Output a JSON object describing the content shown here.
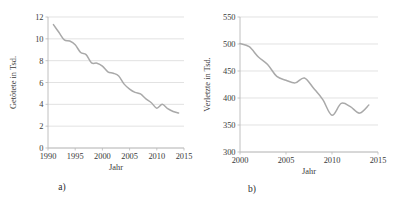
{
  "figure": {
    "panels": [
      {
        "key": "a",
        "label": "a)",
        "chart_data": {
          "type": "line",
          "title": "",
          "xlabel": "Jahr",
          "ylabel": "Getötete in Tsd.",
          "xlim": [
            1990,
            2015
          ],
          "ylim": [
            0,
            12
          ],
          "xticks": [
            1990,
            1995,
            2000,
            2005,
            2010,
            2015
          ],
          "yticks": [
            0,
            2,
            4,
            6,
            8,
            10,
            12
          ],
          "grid": true,
          "legend": "none",
          "line_color": "#a9a9a9",
          "x": [
            1991,
            1992,
            1993,
            1994,
            1995,
            1996,
            1997,
            1998,
            1999,
            2000,
            2001,
            2002,
            2003,
            2004,
            2005,
            2006,
            2007,
            2008,
            2009,
            2010,
            2011,
            2012,
            2013,
            2014
          ],
          "values": [
            11.3,
            10.6,
            9.9,
            9.8,
            9.45,
            8.75,
            8.55,
            7.8,
            7.77,
            7.5,
            6.98,
            6.85,
            6.6,
            5.85,
            5.4,
            5.1,
            4.95,
            4.5,
            4.15,
            3.65,
            4.0,
            3.6,
            3.35,
            3.2
          ]
        }
      },
      {
        "key": "b",
        "label": "b)",
        "chart_data": {
          "type": "line",
          "title": "",
          "xlabel": "Jahr",
          "ylabel": "Verletzte in Tsd.",
          "xlim": [
            2000,
            2015
          ],
          "ylim": [
            300,
            550
          ],
          "xticks": [
            2000,
            2005,
            2010,
            2015
          ],
          "yticks": [
            300,
            350,
            400,
            450,
            500,
            550
          ],
          "grid": true,
          "legend": "none",
          "line_color": "#a9a9a9",
          "x": [
            2000,
            2001,
            2002,
            2003,
            2004,
            2005,
            2006,
            2007,
            2008,
            2009,
            2010,
            2011,
            2012,
            2013,
            2014
          ],
          "values": [
            501,
            495,
            476,
            462,
            440,
            433,
            428,
            437,
            418,
            397,
            368,
            390,
            384,
            372,
            387
          ]
        }
      }
    ]
  }
}
